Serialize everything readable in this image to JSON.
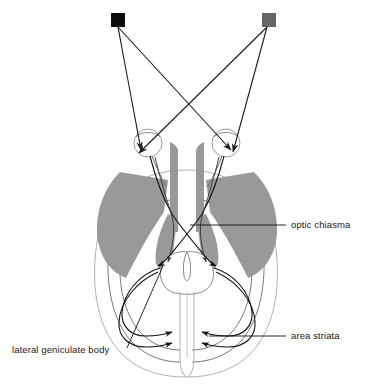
{
  "figure": {
    "background_color": "#ffffff"
  },
  "stimuli": [
    {
      "name": "left-stimulus-square",
      "color": "#0d0d0d",
      "x": 111,
      "y": 13,
      "size": 14
    },
    {
      "name": "right-stimulus-square",
      "color": "#666666",
      "x": 262,
      "y": 13,
      "size": 14
    }
  ],
  "anatomy": {
    "gray_matter_color": "#999999",
    "cortex_outline_color": "#b0b0b0",
    "tract_color": "#111111",
    "eyes": [
      {
        "name": "left-eye",
        "cx": 148,
        "cy": 143
      },
      {
        "name": "right-eye",
        "cx": 226,
        "cy": 143
      }
    ],
    "chiasma_point": {
      "x": 187,
      "y": 228
    },
    "brainstem": {
      "cx": 187,
      "cy": 272
    }
  },
  "labels": [
    {
      "id": "optic-chiasma",
      "text": "optic chiasma",
      "text_x": 291,
      "text_y": 228,
      "anchor": "start",
      "leader": "M 190 225 L 286 225"
    },
    {
      "id": "area-striata",
      "text": "area striata",
      "text_x": 291,
      "text_y": 339,
      "anchor": "start",
      "leader": "M 209 336 L 286 336"
    },
    {
      "id": "lateral-geniculate-body",
      "text": "lateral geniculate body",
      "text_x": 12,
      "text_y": 353,
      "anchor": "start",
      "leader": "M 127 348 L 163 266"
    }
  ],
  "rays": [
    {
      "name": "ray-left-square-to-left-eye",
      "from": "left-stimulus-square",
      "to": "left-eye",
      "color": "#1a1a1a"
    },
    {
      "name": "ray-left-square-to-right-eye",
      "from": "left-stimulus-square",
      "to": "right-eye",
      "color": "#1a1a1a"
    },
    {
      "name": "ray-right-square-to-left-eye",
      "from": "right-stimulus-square",
      "to": "left-eye",
      "color": "#1a1a1a"
    },
    {
      "name": "ray-right-square-to-right-eye",
      "from": "right-stimulus-square",
      "to": "right-eye",
      "color": "#1a1a1a"
    }
  ]
}
